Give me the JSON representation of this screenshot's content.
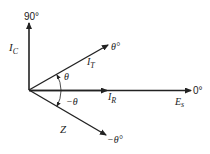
{
  "diagram": {
    "axis_labels": {
      "vertical": "90°",
      "horizontal": "0°"
    },
    "phasors": [
      {
        "name": "I_C",
        "label": "I",
        "sub": "C",
        "angle_label": "90°"
      },
      {
        "name": "I_T",
        "label": "I",
        "sub": "T",
        "angle_label": "θ°"
      },
      {
        "name": "I_R",
        "label": "I",
        "sub": "R",
        "angle_label": "0°"
      },
      {
        "name": "E_s",
        "label": "E",
        "sub": "s",
        "angle_label": "0°"
      },
      {
        "name": "Z",
        "label": "Z",
        "sub": "",
        "angle_label": "−θ°"
      }
    ],
    "angles": {
      "theta": "θ",
      "neg_theta": "−θ"
    },
    "colors": {
      "line": "#222222",
      "background": "#ffffff"
    }
  }
}
